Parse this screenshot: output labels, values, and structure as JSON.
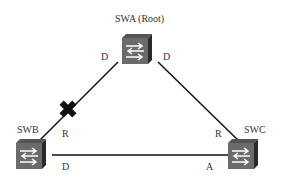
{
  "diagram": {
    "nodes": [
      {
        "id": "swa",
        "label": "SWA (Root)",
        "type": "switch"
      },
      {
        "id": "swb",
        "label": "SWB",
        "type": "switch"
      },
      {
        "id": "swc",
        "label": "SWC",
        "type": "switch"
      }
    ],
    "links": [
      {
        "from": "swa",
        "to": "swb",
        "from_port_role": "D",
        "to_port_role": "R",
        "blocked": true,
        "blocked_marker": "X"
      },
      {
        "from": "swa",
        "to": "swc",
        "from_port_role": "D",
        "to_port_role": "R",
        "blocked": false
      },
      {
        "from": "swb",
        "to": "swc",
        "from_port_role": "D",
        "to_port_role": "A",
        "blocked": false
      }
    ],
    "port_labels": {
      "swa_left": "D",
      "swa_right": "D",
      "swb_up": "R",
      "swb_right": "D",
      "swc_up": "R",
      "swc_left": "A"
    },
    "colors": {
      "line": "#111111",
      "switch_face": "#6b6b6b",
      "switch_side": "#2a2a2a",
      "arrow": "#ffffff",
      "blocked_marker": "#111111"
    }
  }
}
